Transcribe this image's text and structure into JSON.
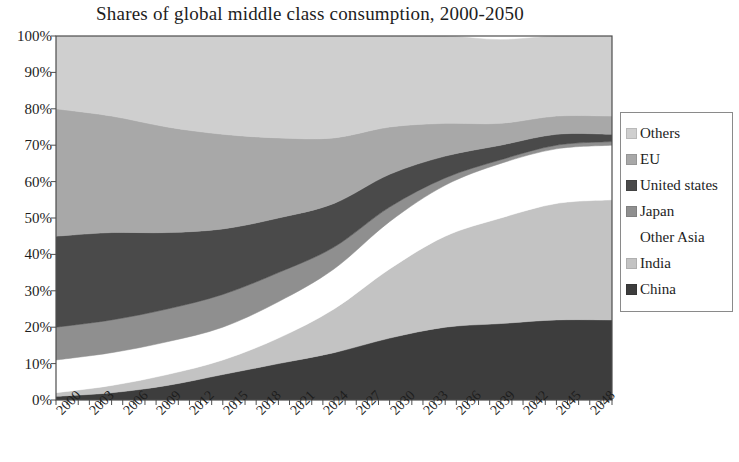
{
  "chart_data": {
    "type": "area",
    "title": "Shares of global middle class consumption, 2000-2050",
    "xlabel": "",
    "ylabel": "",
    "stacked": true,
    "normalized_percent": true,
    "grid": false,
    "legend_position": "right",
    "xlim": [
      2000,
      2050
    ],
    "ylim": [
      0,
      100
    ],
    "ytick_labels": [
      "100%",
      "90%",
      "80%",
      "70%",
      "60%",
      "50%",
      "40%",
      "30%",
      "20%",
      "10%",
      "0%"
    ],
    "ytick_values": [
      100,
      90,
      80,
      70,
      60,
      50,
      40,
      30,
      20,
      10,
      0
    ],
    "xtick_labels": [
      "2000",
      "2003",
      "2006",
      "2009",
      "2012",
      "2015",
      "2018",
      "2021",
      "2024",
      "2027",
      "2030",
      "2033",
      "2036",
      "2039",
      "2042",
      "2045",
      "2048"
    ],
    "xtick_values": [
      2000,
      2003,
      2006,
      2009,
      2012,
      2015,
      2018,
      2021,
      2024,
      2027,
      2030,
      2033,
      2036,
      2039,
      2042,
      2045,
      2048
    ],
    "x": [
      2000,
      2005,
      2010,
      2015,
      2020,
      2025,
      2030,
      2035,
      2040,
      2045,
      2050
    ],
    "stack_order_bottom_to_top": [
      "China",
      "India",
      "Other Asia",
      "Japan",
      "United states",
      "EU",
      "Others"
    ],
    "series": [
      {
        "name": "China",
        "color": "#3d3d3d",
        "values": [
          1,
          2,
          4,
          7,
          10,
          13,
          17,
          20,
          21,
          22,
          22
        ]
      },
      {
        "name": "India",
        "color": "#c3c3c3",
        "values": [
          1,
          2,
          3,
          4,
          7,
          12,
          19,
          25,
          29,
          32,
          33
        ]
      },
      {
        "name": "Other Asia",
        "color": "#ffffff",
        "values": [
          9,
          9,
          9,
          9,
          10,
          11,
          13,
          14,
          15,
          15,
          15
        ]
      },
      {
        "name": "Japan",
        "color": "#8f8f8f",
        "values": [
          9,
          9,
          9,
          9,
          8,
          6,
          4,
          2,
          1,
          1,
          1
        ]
      },
      {
        "name": "United states",
        "color": "#4a4a4a",
        "values": [
          25,
          24,
          21,
          18,
          15,
          12,
          9,
          6,
          4,
          3,
          2
        ]
      },
      {
        "name": "EU",
        "color": "#a8a8a8",
        "values": [
          35,
          32,
          29,
          26,
          22,
          18,
          13,
          9,
          6,
          5,
          5
        ]
      },
      {
        "name": "Others",
        "color": "#cfcfcf",
        "values": [
          20,
          22,
          25,
          27,
          28,
          28,
          25,
          24,
          23,
          22,
          22
        ]
      }
    ]
  },
  "legend": {
    "items": [
      {
        "label": "Others",
        "color": "#cfcfcf",
        "blank": false
      },
      {
        "label": "EU",
        "color": "#a8a8a8",
        "blank": false
      },
      {
        "label": "United states",
        "color": "#4a4a4a",
        "blank": false
      },
      {
        "label": "Japan",
        "color": "#8f8f8f",
        "blank": false
      },
      {
        "label": "Other Asia",
        "color": "#ffffff",
        "blank": true
      },
      {
        "label": "India",
        "color": "#c3c3c3",
        "blank": false
      },
      {
        "label": "China",
        "color": "#3d3d3d",
        "blank": false
      }
    ]
  },
  "axes": {
    "frame_color": "#4d4d4d"
  }
}
